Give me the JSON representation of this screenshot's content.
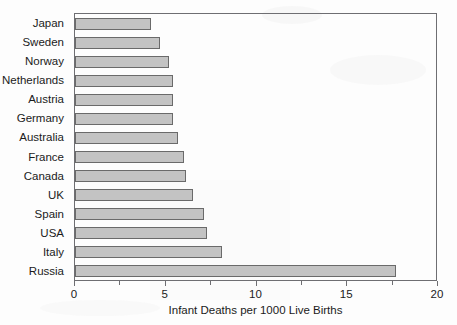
{
  "chart_data": {
    "type": "bar",
    "orientation": "horizontal",
    "title": "",
    "xlabel": "Infant Deaths per 1000 Live Births",
    "ylabel": "",
    "xlim": [
      0,
      20
    ],
    "xticks": [
      0,
      5,
      10,
      15,
      20
    ],
    "xticklabels": [
      "0",
      "5",
      "10",
      "15",
      "20"
    ],
    "minor_tick_interval": 2.5,
    "grid": false,
    "legend": null,
    "bar_color": "#c3c3c3",
    "bar_edge_color": "#6a6a6a",
    "frame_color": "#6e6e72",
    "categories": [
      "Japan",
      "Sweden",
      "Norway",
      "Netherlands",
      "Austria",
      "Germany",
      "Australia",
      "France",
      "Canada",
      "UK",
      "Spain",
      "USA",
      "Italy",
      "Russia"
    ],
    "values": [
      4.2,
      4.7,
      5.2,
      5.4,
      5.4,
      5.4,
      5.7,
      6.0,
      6.1,
      6.5,
      7.1,
      7.3,
      8.1,
      17.7
    ]
  }
}
